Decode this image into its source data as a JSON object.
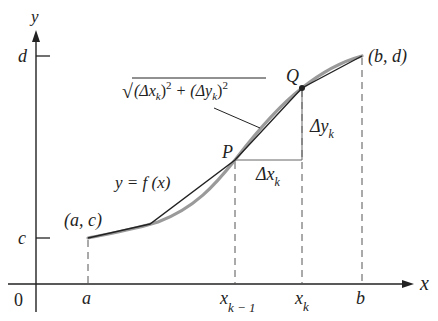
{
  "diagram": {
    "colors": {
      "ink": "#222222",
      "curve": "#9a9a9a",
      "dash": "#555555"
    },
    "axes": {
      "x_label": "x",
      "y_label": "y",
      "origin_label": "0"
    },
    "x_ticks": {
      "a": "a",
      "xk_minus_1_base": "x",
      "xk_minus_1_sub": "k − 1",
      "xk_base": "x",
      "xk_sub": "k",
      "b": "b"
    },
    "y_ticks": {
      "c": "c",
      "d": "d"
    },
    "points": {
      "start": "(a, c)",
      "end": "(b, d)",
      "P": "P",
      "Q": "Q"
    },
    "function_label": "y = f (x)",
    "segment_label": {
      "prefix": "√",
      "body1": "(Δx",
      "sub1": "k",
      "body2": ")",
      "sup1": "2",
      "plus": " + (Δy",
      "sub2": "k",
      "body3": ")",
      "sup2": "2"
    },
    "delta_x": {
      "base": "Δx",
      "sub": "k"
    },
    "delta_y": {
      "base": "Δy",
      "sub": "k"
    }
  }
}
